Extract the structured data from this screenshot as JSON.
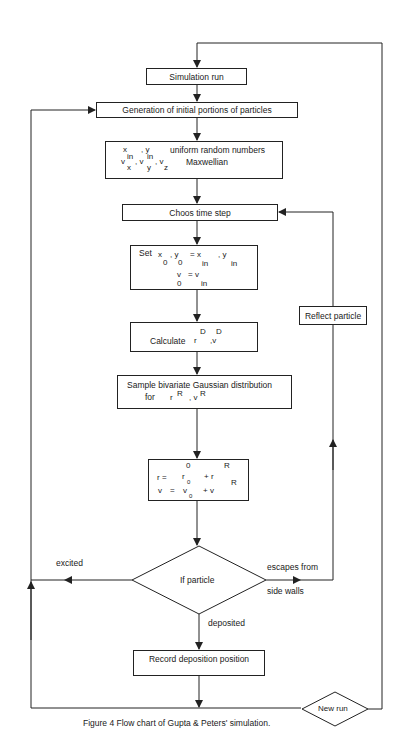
{
  "nodes": {
    "simulation_run": "Simulation run",
    "generation": "Generation of initial portions of particles",
    "init_line1_text": "uniform random numbers",
    "init_line2_text": "Maxwellian",
    "init_vars1": [
      "x",
      ", y"
    ],
    "init_vars2": [
      "v",
      "in",
      "x",
      ", v",
      "in",
      "y",
      ", v",
      "z"
    ],
    "choose_time_step": "Choos time step",
    "set_label": "Set",
    "set_line1": [
      "x",
      "0",
      ", y",
      "0",
      "= x",
      "in",
      ", y",
      "in"
    ],
    "set_line2": [
      "v",
      "0",
      "= v",
      "in"
    ],
    "calculate_label": "Calculate",
    "calculate_vars": [
      "r",
      "D",
      ",v",
      "D"
    ],
    "sample_line1": "Sample bivariate Gaussian distribution",
    "sample_line2_prefix": "for",
    "sample_vars": [
      "r",
      "R",
      ", v",
      "R"
    ],
    "update_line1": [
      "r =",
      "r",
      "0",
      "0",
      "+ r",
      "R"
    ],
    "update_line2": [
      "v",
      "=",
      "v",
      "0",
      "+ v",
      "R"
    ],
    "decision": "If particle",
    "record": "Record  deposition position",
    "new_run": "New run",
    "reflect": "Reflect particle"
  },
  "edges": {
    "excited": "excited",
    "escapes_line1": "escapes from",
    "escapes_line2": "side walls",
    "deposited": "deposited"
  },
  "caption": "Figure 4  Flow chart of Gupta & Peters' simulation.",
  "colors": {
    "line": "#222222",
    "background": "#ffffff"
  }
}
